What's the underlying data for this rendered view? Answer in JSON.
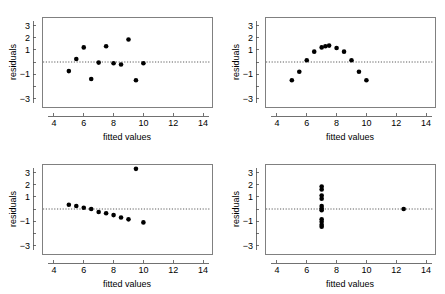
{
  "figure": {
    "panel_count": 4,
    "layout": "2x2",
    "background_color": "#ffffff",
    "point_color": "#000000",
    "box_color": "#808080",
    "zero_line_color": "#333333"
  },
  "axes": {
    "xlabel": "fitted values",
    "ylabel": "residuals",
    "xticks": [
      4,
      6,
      8,
      10,
      12,
      14
    ],
    "xtick_labels": [
      "4",
      "6",
      "8",
      "10",
      "12",
      "14"
    ],
    "yticks": [
      3,
      2,
      1,
      0,
      -1,
      -2,
      -3
    ],
    "ytick_labels": [
      "3",
      "2",
      "1",
      "",
      "−1",
      "",
      "−3"
    ],
    "xlim": [
      3.2,
      14.6
    ],
    "ylim": [
      -3.7,
      3.7
    ],
    "zero_reference": 0,
    "grid": false
  },
  "chart_data": [
    {
      "type": "scatter",
      "title": "",
      "panel": "top-left",
      "pattern": "random scatter - homoscedastic residuals",
      "xlabel": "fitted values",
      "ylabel": "residuals",
      "xlim": [
        3.2,
        14.6
      ],
      "ylim": [
        -3.7,
        3.7
      ],
      "x": [
        5.0,
        5.5,
        6.0,
        6.5,
        7.0,
        7.5,
        8.0,
        8.5,
        9.0,
        9.5,
        10.0
      ],
      "y": [
        -0.75,
        0.25,
        1.2,
        -1.4,
        -0.05,
        1.3,
        -0.1,
        -0.2,
        1.85,
        -1.5,
        -0.1
      ]
    },
    {
      "type": "scatter",
      "title": "",
      "panel": "top-right",
      "pattern": "curvature - quadratic pattern in residuals",
      "xlabel": "fitted values",
      "ylabel": "residuals",
      "xlim": [
        3.2,
        14.6
      ],
      "ylim": [
        -3.7,
        3.7
      ],
      "x": [
        5.0,
        5.5,
        6.0,
        6.5,
        7.0,
        7.25,
        7.5,
        8.0,
        8.5,
        9.0,
        9.5,
        10.0
      ],
      "y": [
        -1.5,
        -0.8,
        0.15,
        0.85,
        1.2,
        1.3,
        1.35,
        1.15,
        0.85,
        0.15,
        -0.8,
        -1.5
      ]
    },
    {
      "type": "scatter",
      "title": "",
      "panel": "bottom-left",
      "pattern": "downward trend with single high outlier",
      "xlabel": "fitted values",
      "ylabel": "residuals",
      "xlim": [
        3.2,
        14.6
      ],
      "ylim": [
        -3.7,
        3.7
      ],
      "x": [
        5.0,
        5.5,
        6.0,
        6.5,
        7.0,
        7.5,
        8.0,
        8.5,
        9.0,
        9.5,
        10.0
      ],
      "y": [
        0.35,
        0.25,
        0.1,
        0.0,
        -0.25,
        -0.35,
        -0.5,
        -0.7,
        -0.85,
        3.3,
        -1.1
      ]
    },
    {
      "type": "scatter",
      "title": "",
      "panel": "bottom-right",
      "pattern": "vertical cluster at single fitted value plus high-leverage point",
      "xlabel": "fitted values",
      "ylabel": "residuals",
      "xlim": [
        3.2,
        14.6
      ],
      "ylim": [
        -3.7,
        3.7
      ],
      "x": [
        7.0,
        7.0,
        7.0,
        7.0,
        7.0,
        7.0,
        7.0,
        7.0,
        7.0,
        7.0,
        7.0,
        12.5
      ],
      "y": [
        1.85,
        1.6,
        1.1,
        0.85,
        0.25,
        0.05,
        -0.1,
        -0.85,
        -1.05,
        -1.3,
        -1.45,
        0.0
      ]
    }
  ]
}
